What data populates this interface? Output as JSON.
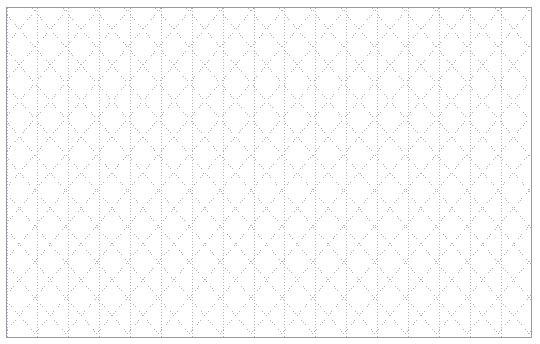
{
  "page": {
    "width": 540,
    "height": 344,
    "background_color": "#ffffff"
  },
  "frame": {
    "label": "sheet-border",
    "x": 6,
    "y": 7,
    "width": 526,
    "height": 331,
    "border_color": "#9a9aa2",
    "border_width": 1,
    "fill_color": "#ffffff"
  },
  "grid": {
    "label": "isometric-triangular-dot-grid",
    "pattern_type": "isometric-triangle",
    "dot_color": "#b2b2ba",
    "line_style": "dotted",
    "dot_size": 1,
    "dot_gap": 2,
    "stroke_width": 1,
    "column_spacing_px": 31,
    "row_spacing_px": 18,
    "diagonal_angle_degrees": 60,
    "vertical_line_count": 18,
    "diagonal_right_line_count": 40,
    "diagonal_left_line_count": 40,
    "orientation": "vertical-plus-two-diagonals"
  },
  "chart_data": {
    "type": "table",
    "xlabel": "",
    "ylabel": "",
    "categories": [
      "vertical",
      "diagonal-right",
      "diagonal-left"
    ],
    "values": [
      18,
      40,
      40
    ],
    "grid": true,
    "legend": "none"
  }
}
